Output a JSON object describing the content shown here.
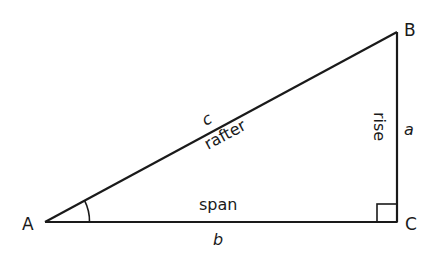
{
  "diagram": {
    "type": "right-triangle",
    "vertices": [
      {
        "id": "A",
        "label": "A"
      },
      {
        "id": "B",
        "label": "B"
      },
      {
        "id": "C",
        "label": "C"
      }
    ],
    "sides": {
      "hypotenuse": {
        "letter": "c",
        "name": "rafter"
      },
      "vertical": {
        "letter": "a",
        "name": "rise"
      },
      "horizontal": {
        "letter": "b",
        "name": "span"
      }
    },
    "markers": {
      "right_angle_at": "C",
      "angle_arc_at": "A"
    },
    "colors": {
      "line": "#1a1a1a",
      "background": "#ffffff"
    }
  }
}
